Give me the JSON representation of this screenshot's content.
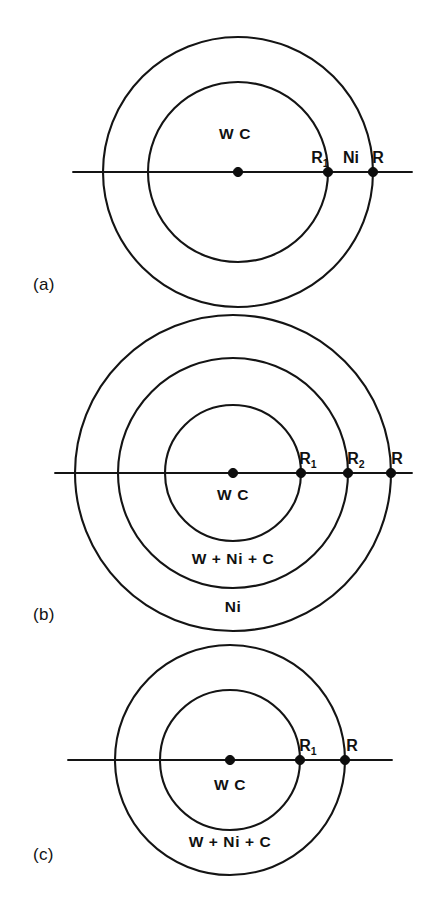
{
  "figure": {
    "background_color": "#ffffff",
    "line_color": "#141414",
    "text_color": "#111111"
  },
  "panels": [
    {
      "id": "a",
      "caption": "(a)",
      "caption_x": 33,
      "caption_y": 290,
      "center_x": 238,
      "center_y": 172,
      "axis_x1": 73,
      "axis_x2": 412,
      "rings": [
        {
          "name": "inner-ring",
          "radius": 90
        },
        {
          "name": "outer-ring",
          "radius": 135
        }
      ],
      "zone_labels": [
        {
          "text": "W C",
          "x": 235,
          "y": 139,
          "anchor": "middle"
        }
      ],
      "radius_markers": [
        {
          "label": "",
          "sub": "",
          "x": 238,
          "dot": true,
          "label_x": 238,
          "label_y": 150
        },
        {
          "label": "R",
          "sub": "1",
          "x": 328,
          "dot": true,
          "label_x": 320,
          "label_y": 163
        },
        {
          "label": "R",
          "sub": "",
          "x": 373,
          "dot": true,
          "label_x": 378,
          "label_y": 163
        }
      ],
      "between_labels": [
        {
          "text": "Ni",
          "x": 351,
          "y": 163
        }
      ]
    },
    {
      "id": "b",
      "caption": "(b)",
      "caption_x": 33,
      "caption_y": 620,
      "center_x": 233,
      "center_y": 473,
      "axis_x1": 55,
      "axis_x2": 412,
      "rings": [
        {
          "name": "inner-ring",
          "radius": 68
        },
        {
          "name": "middle-ring",
          "radius": 115
        },
        {
          "name": "outer-ring",
          "radius": 158
        }
      ],
      "zone_labels": [
        {
          "text": "W C",
          "x": 233,
          "y": 500,
          "anchor": "middle"
        },
        {
          "text": "W + Ni + C",
          "x": 233,
          "y": 564,
          "anchor": "middle"
        },
        {
          "text": "Ni",
          "x": 233,
          "y": 612,
          "anchor": "middle"
        }
      ],
      "radius_markers": [
        {
          "label": "",
          "sub": "",
          "x": 233,
          "dot": true,
          "label_x": 233,
          "label_y": 452
        },
        {
          "label": "R",
          "sub": "1",
          "x": 301,
          "dot": true,
          "label_x": 308,
          "label_y": 464
        },
        {
          "label": "R",
          "sub": "2",
          "x": 348,
          "dot": true,
          "label_x": 356,
          "label_y": 464
        },
        {
          "label": "R",
          "sub": "",
          "x": 391,
          "dot": true,
          "label_x": 397,
          "label_y": 464
        }
      ],
      "between_labels": []
    },
    {
      "id": "c",
      "caption": "(c)",
      "caption_x": 33,
      "caption_y": 860,
      "center_x": 230,
      "center_y": 760,
      "axis_x1": 68,
      "axis_x2": 392,
      "rings": [
        {
          "name": "inner-ring",
          "radius": 70
        },
        {
          "name": "outer-ring",
          "radius": 115
        }
      ],
      "zone_labels": [
        {
          "text": "W C",
          "x": 230,
          "y": 790,
          "anchor": "middle"
        },
        {
          "text": "W + Ni + C",
          "x": 230,
          "y": 847,
          "anchor": "middle"
        }
      ],
      "radius_markers": [
        {
          "label": "",
          "sub": "",
          "x": 230,
          "dot": true,
          "label_x": 230,
          "label_y": 740
        },
        {
          "label": "R",
          "sub": "1",
          "x": 300,
          "dot": true,
          "label_x": 308,
          "label_y": 751
        },
        {
          "label": "R",
          "sub": "",
          "x": 345,
          "dot": true,
          "label_x": 352,
          "label_y": 751
        }
      ],
      "between_labels": []
    }
  ],
  "legend_text": {
    "wc_zone": "W C",
    "mixed_zone": "W + Ni + C",
    "ni_zone": "Ni",
    "radius_outer": "R",
    "radius_1": "R1",
    "radius_2": "R2"
  }
}
